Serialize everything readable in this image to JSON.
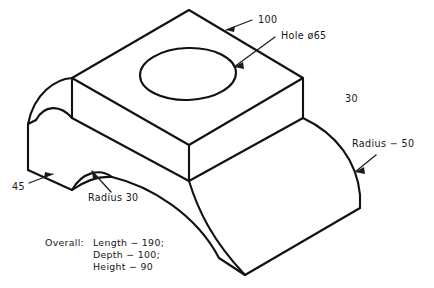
{
  "drawing": {
    "title": "Isometric view of machined block",
    "background_color": "#ffffff",
    "line_color": "#111111",
    "text_color": "#161616"
  },
  "annotations": {
    "top_width": "100",
    "hole": "Hole ø65",
    "right_height": "30",
    "radius_large": "Radius − 50",
    "left_thickness": "45",
    "radius_small": "Radius 30"
  },
  "overall_note": {
    "prefix": "Overall:",
    "line_1": "Length − 190;",
    "line_2": "Depth − 100;",
    "line_3": "Height − 90"
  }
}
